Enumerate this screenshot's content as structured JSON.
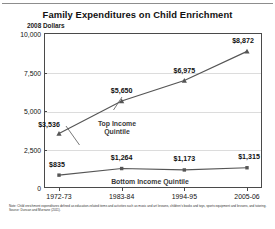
{
  "chart_data": {
    "type": "line",
    "title": "Family Expenditures on Child Enrichment",
    "subtitle": "2008 Dollars",
    "ylabel": "2008 Dollars",
    "xlabel": "",
    "categories": [
      "1972-73",
      "1983-84",
      "1994-95",
      "2005-06"
    ],
    "ylim": [
      0,
      10000
    ],
    "yticks": [
      0,
      2500,
      5000,
      7500,
      10000
    ],
    "ytick_labels": [
      "0",
      "2,500",
      "5,000",
      "7,500",
      "10,000"
    ],
    "grid": true,
    "legend_position": "inline",
    "series": [
      {
        "name": "Top Income Quintile",
        "marker": "triangle",
        "color": "#555555",
        "values": [
          3536,
          5650,
          6975,
          8872
        ],
        "data_labels": [
          "$3,536",
          "$5,650",
          "$6,975",
          "$8,872"
        ]
      },
      {
        "name": "Bottom Income Quintile",
        "marker": "square",
        "color": "#555555",
        "values": [
          835,
          1264,
          1173,
          1315
        ],
        "data_labels": [
          "$835",
          "$1,264",
          "$1,173",
          "$1,315"
        ]
      }
    ]
  },
  "footnotes": {
    "note": "Note: Child enrichment expenditures defined as education-related items and activities such as music and art lessons, children's books and toys, sports equipment and lessons, and tutoring.",
    "source": "Source: Duncan and Murnane (2011)."
  }
}
